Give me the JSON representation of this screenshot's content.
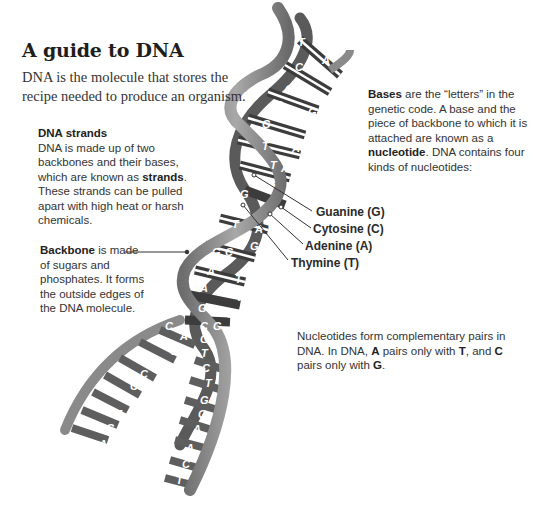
{
  "title": "A guide to DNA",
  "intro": "DNA is the molecule that stores the recipe needed to produce an organism.",
  "strands": {
    "heading": "DNA strands",
    "text_before": "DNA is made up of two backbones and their bases, which are known as ",
    "bold": "strands",
    "text_after": ". These strands can be pulled apart with high heat or harsh chemicals."
  },
  "backbone": {
    "bold": "Backbone",
    "text": " is made of sugars and phosphates. It forms the outside edges of the DNA molecule."
  },
  "bases": {
    "bold1": "Bases",
    "text1": " are the “letters” in the genetic code. A base and the piece of backbone to which it is attached are known as a ",
    "bold2": "nucleotide",
    "text2": ". DNA contains four kinds of nucleotides:"
  },
  "nucleotides": [
    {
      "name": "Guanine (G)",
      "letter": "G"
    },
    {
      "name": "Cytosine (C)",
      "letter": "C"
    },
    {
      "name": "Adenine (A)",
      "letter": "A"
    },
    {
      "name": "Thymine (T)",
      "letter": "T"
    }
  ],
  "pairs": {
    "t1": "Nucleotides form complementary pairs in DNA. In DNA, ",
    "b1": "A",
    "t2": " pairs only with ",
    "b2": "T",
    "t3": ", and ",
    "b3": "C",
    "t4": " pairs only with ",
    "b4": "G",
    "t5": "."
  },
  "colors": {
    "backbone": "#8c8c8c",
    "base_dark": "#3a3a3a",
    "base_mid": "#6e6e6e",
    "text": "#333333"
  }
}
